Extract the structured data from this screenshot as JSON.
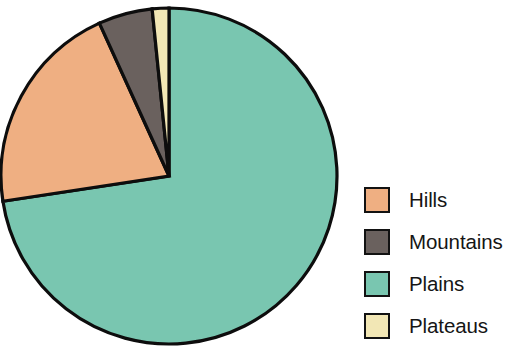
{
  "chart_data": {
    "type": "pie",
    "title": "",
    "subtitle": "",
    "xlabel": "",
    "ylabel": "",
    "grid": false,
    "legend_position": "right",
    "start_angle_deg": 90,
    "direction": "clockwise",
    "categories": [
      "Plains",
      "Hills",
      "Mountains",
      "Plateaus"
    ],
    "values": [
      72.6,
      20.6,
      5.2,
      1.6
    ],
    "units": "percent",
    "slices": [
      {
        "label": "Plains",
        "value": 72.6,
        "color": "#79c6b0",
        "start_angle_deg": 90,
        "end_angle_deg": -171.5,
        "sweep_deg": 261.5,
        "legend_index": 2
      },
      {
        "label": "Hills",
        "value": 20.6,
        "color": "#efaf82",
        "start_angle_deg": 188.5,
        "end_angle_deg": 114.4,
        "sweep_deg": 74.1,
        "legend_index": 0
      },
      {
        "label": "Mountains",
        "value": 5.2,
        "color": "#6a615e",
        "start_angle_deg": 114.4,
        "end_angle_deg": 95.8,
        "sweep_deg": 18.6,
        "legend_index": 1
      },
      {
        "label": "Plateaus",
        "value": 1.6,
        "color": "#f2e7b5",
        "start_angle_deg": 95.8,
        "end_angle_deg": 90,
        "sweep_deg": 5.8,
        "legend_index": 3
      }
    ],
    "geometry": {
      "center_x": 169,
      "center_y": 176,
      "radius": 168,
      "outline_color": "#0d0d0d"
    }
  },
  "legend": {
    "items": [
      {
        "label": "Hills",
        "color": "#efaf82"
      },
      {
        "label": "Mountains",
        "color": "#6a615e"
      },
      {
        "label": "Plains",
        "color": "#79c6b0"
      },
      {
        "label": "Plateaus",
        "color": "#f2e7b5"
      }
    ]
  }
}
